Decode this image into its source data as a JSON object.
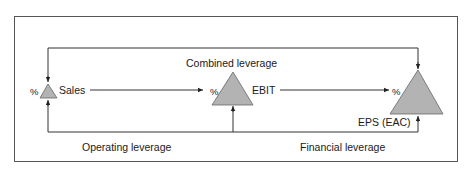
{
  "diagram": {
    "nodes": [
      {
        "id": "sales",
        "label": "Sales",
        "prefix": "%"
      },
      {
        "id": "ebit",
        "label": "EBIT",
        "prefix": "%"
      },
      {
        "id": "eps",
        "label": "EPS (EAC)",
        "prefix": "%"
      }
    ],
    "edges": [
      {
        "from": "sales",
        "to": "ebit"
      },
      {
        "from": "ebit",
        "to": "eps"
      }
    ],
    "brackets": {
      "combined": "Combined leverage",
      "operating": "Operating leverage",
      "financial": "Financial leverage"
    },
    "colors": {
      "triangle_fill": "#b3b3b3",
      "line": "#333333",
      "frame": "#555555"
    }
  }
}
